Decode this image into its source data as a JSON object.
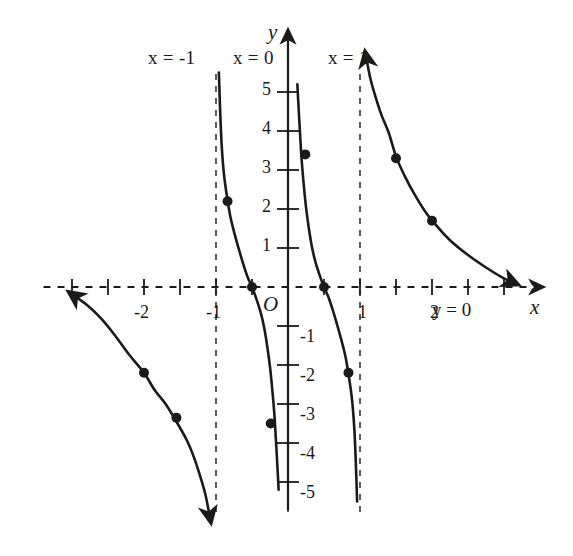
{
  "figure": {
    "kind": "function-graph",
    "background_color": "#ffffff",
    "ink_color": "#1a1a1a"
  },
  "axes": {
    "x_axis_name": "x",
    "y_axis_name": "y",
    "origin_label": "O",
    "x_tick_labels": [
      "-2",
      "-1",
      "1",
      "2"
    ],
    "y_tick_labels_positive": [
      "1",
      "2",
      "3",
      "4",
      "5"
    ],
    "y_tick_labels_negative": [
      "-1",
      "-2",
      "-3",
      "-4",
      "-5"
    ]
  },
  "asymptote_labels": {
    "vertical_left": "x = -1",
    "vertical_middle": "x = 0",
    "vertical_right": "x = 1",
    "horizontal": "y = 0"
  },
  "chart_data": {
    "type": "line",
    "title": "",
    "xlabel": "x",
    "ylabel": "y",
    "xlim": [
      -3.1,
      3.3
    ],
    "ylim": [
      -6.2,
      5.9
    ],
    "grid": false,
    "legend": "none",
    "x_ticks": [
      -2,
      -1,
      1,
      2
    ],
    "y_ticks": [
      1,
      2,
      3,
      4,
      5,
      -1,
      -2,
      -3,
      -4,
      -5
    ],
    "x_minor_tick_step": 0.5,
    "asymptotes": {
      "vertical": [
        -1,
        0,
        1
      ],
      "horizontal": [
        0
      ]
    },
    "x_intercepts": [
      -0.5,
      0.5
    ],
    "series": [
      {
        "name": "branch-far-left",
        "comment": "x < -1, decreasing from 0- down to -infinity at x=-1",
        "points": [
          [
            -3.05,
            -0.12
          ],
          [
            -2.8,
            -0.45
          ],
          [
            -2.6,
            -0.8
          ],
          [
            -2.4,
            -1.25
          ],
          [
            -2.2,
            -1.75
          ],
          [
            -2.0,
            -2.2
          ],
          [
            -1.85,
            -2.65
          ],
          [
            -1.7,
            -3.0
          ],
          [
            -1.55,
            -3.45
          ],
          [
            -1.4,
            -3.95
          ],
          [
            -1.3,
            -4.4
          ],
          [
            -1.22,
            -4.85
          ],
          [
            -1.15,
            -5.3
          ],
          [
            -1.1,
            -5.75
          ],
          [
            -1.07,
            -6.05
          ]
        ],
        "arrows": [
          "start",
          "end"
        ],
        "marked_points": [
          [
            -2.0,
            -2.2
          ],
          [
            -1.55,
            -3.35
          ]
        ]
      },
      {
        "name": "branch-left-middle",
        "comment": "-1 < x < 0, from +infinity at x=-1 down through (-0.5,0) to -infinity at x=0",
        "points": [
          [
            -0.96,
            5.5
          ],
          [
            -0.94,
            4.4
          ],
          [
            -0.92,
            3.6
          ],
          [
            -0.89,
            2.9
          ],
          [
            -0.85,
            2.35
          ],
          [
            -0.8,
            1.8
          ],
          [
            -0.74,
            1.35
          ],
          [
            -0.68,
            0.95
          ],
          [
            -0.62,
            0.58
          ],
          [
            -0.56,
            0.25
          ],
          [
            -0.5,
            0.0
          ],
          [
            -0.44,
            -0.3
          ],
          [
            -0.38,
            -0.65
          ],
          [
            -0.33,
            -1.05
          ],
          [
            -0.29,
            -1.5
          ],
          [
            -0.25,
            -2.05
          ],
          [
            -0.22,
            -2.6
          ],
          [
            -0.19,
            -3.25
          ],
          [
            -0.17,
            -3.85
          ],
          [
            -0.15,
            -4.5
          ],
          [
            -0.13,
            -5.2
          ]
        ],
        "arrows": [],
        "marked_points": [
          [
            -0.84,
            2.2
          ],
          [
            -0.24,
            -3.5
          ]
        ]
      },
      {
        "name": "branch-right-middle",
        "comment": "0 < x < 1, from +infinity at x=0 down through (0.5,0) to -infinity at x=1",
        "points": [
          [
            0.13,
            5.2
          ],
          [
            0.15,
            4.5
          ],
          [
            0.17,
            3.85
          ],
          [
            0.19,
            3.25
          ],
          [
            0.22,
            2.6
          ],
          [
            0.25,
            2.05
          ],
          [
            0.29,
            1.5
          ],
          [
            0.33,
            1.05
          ],
          [
            0.38,
            0.65
          ],
          [
            0.44,
            0.3
          ],
          [
            0.5,
            0.0
          ],
          [
            0.56,
            -0.25
          ],
          [
            0.62,
            -0.58
          ],
          [
            0.68,
            -0.95
          ],
          [
            0.74,
            -1.35
          ],
          [
            0.8,
            -1.8
          ],
          [
            0.85,
            -2.35
          ],
          [
            0.89,
            -2.9
          ],
          [
            0.92,
            -3.6
          ],
          [
            0.94,
            -4.4
          ],
          [
            0.96,
            -5.5
          ]
        ],
        "arrows": [],
        "marked_points": [
          [
            0.24,
            3.4
          ],
          [
            0.84,
            -2.2
          ]
        ]
      },
      {
        "name": "branch-far-right",
        "comment": "x > 1, from +infinity at x=1 decreasing toward 0+",
        "points": [
          [
            1.07,
            6.05
          ],
          [
            1.1,
            5.75
          ],
          [
            1.15,
            5.3
          ],
          [
            1.22,
            4.85
          ],
          [
            1.3,
            4.4
          ],
          [
            1.4,
            3.95
          ],
          [
            1.5,
            3.35
          ],
          [
            1.62,
            2.85
          ],
          [
            1.75,
            2.4
          ],
          [
            1.9,
            1.95
          ],
          [
            2.05,
            1.6
          ],
          [
            2.25,
            1.2
          ],
          [
            2.5,
            0.82
          ],
          [
            2.75,
            0.5
          ],
          [
            3.0,
            0.22
          ],
          [
            3.2,
            0.06
          ]
        ],
        "arrows": [
          "start",
          "end"
        ],
        "marked_points": [
          [
            1.5,
            3.3
          ],
          [
            2.0,
            1.7
          ]
        ]
      }
    ]
  }
}
